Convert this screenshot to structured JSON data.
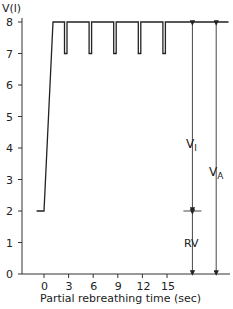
{
  "chart_data": {
    "type": "line",
    "title": "",
    "ylabel": "V(l)",
    "xlabel": "Partial rebreathing time (sec)",
    "ylim": [
      0,
      8
    ],
    "yticks": [
      0,
      1,
      2,
      3,
      4,
      5,
      6,
      7,
      8
    ],
    "xticks": [
      0,
      3,
      6,
      9,
      12,
      15
    ],
    "grid": false,
    "legend": null,
    "series": [
      {
        "name": "Lung volume",
        "points": [
          [
            -0.9,
            2
          ],
          [
            0,
            2
          ],
          [
            1.1,
            8
          ],
          [
            2.5,
            8
          ],
          [
            2.5,
            7
          ],
          [
            2.8,
            7
          ],
          [
            2.8,
            8
          ],
          [
            5.5,
            8
          ],
          [
            5.5,
            7
          ],
          [
            5.8,
            7
          ],
          [
            5.8,
            8
          ],
          [
            8.5,
            8
          ],
          [
            8.5,
            7
          ],
          [
            8.8,
            7
          ],
          [
            8.8,
            8
          ],
          [
            11.5,
            8
          ],
          [
            11.5,
            7
          ],
          [
            11.8,
            7
          ],
          [
            11.8,
            8
          ],
          [
            14.5,
            8
          ],
          [
            14.5,
            7
          ],
          [
            14.8,
            7
          ],
          [
            14.8,
            8
          ],
          [
            22.5,
            8
          ]
        ]
      }
    ],
    "annotations": [
      {
        "label": "V",
        "sub": "I",
        "type": "double-arrow",
        "from": 8,
        "to": 2,
        "x_sec": 18.1
      },
      {
        "label": "RV",
        "type": "double-arrow",
        "from": 2,
        "to": 0,
        "x_sec": 18.1
      },
      {
        "label": "V",
        "sub": "A",
        "type": "double-arrow",
        "from": 8,
        "to": 0,
        "x_sec": 21.0
      }
    ]
  },
  "axis": {
    "y_title": "V(l)",
    "x_title": "Partial rebreathing time (sec)",
    "y_tick_labels": [
      "0",
      "1",
      "2",
      "3",
      "4",
      "5",
      "6",
      "7",
      "8"
    ],
    "x_tick_labels": [
      "0",
      "3",
      "6",
      "9",
      "12",
      "15"
    ]
  },
  "labels": {
    "vi_main": "V",
    "vi_sub": "I",
    "va_main": "V",
    "va_sub": "A",
    "rv": "RV"
  }
}
